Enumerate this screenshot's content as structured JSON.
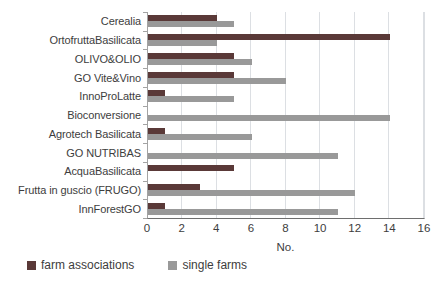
{
  "chart_data": {
    "type": "bar",
    "orientation": "horizontal",
    "title": "",
    "categories": [
      "Cerealia",
      "OrtofruttaBasilicata",
      "OLIVO&OLIO",
      "GO Vite&Vino",
      "InnoProLatte",
      "Bioconversione",
      "Agrotech Basilicata",
      "GO NUTRIBAS",
      "AcquaBasilicata",
      "Frutta in guscio (FRUGO)",
      "InnForestGO"
    ],
    "series": [
      {
        "name": "farm associations",
        "color": "#5a3938",
        "values": [
          4,
          14,
          5,
          5,
          1,
          0,
          1,
          0,
          5,
          3,
          1
        ]
      },
      {
        "name": "single farms",
        "color": "#999999",
        "values": [
          5,
          4,
          6,
          8,
          5,
          14,
          6,
          11,
          0,
          12,
          11
        ]
      }
    ],
    "xlabel": "No.",
    "xlim": [
      0,
      16
    ],
    "xticks": [
      0,
      2,
      4,
      6,
      8,
      10,
      12,
      14,
      16
    ],
    "grid": true,
    "gridline_color": "#dcdfe3",
    "axis_text_color": "#3d3d3d",
    "legend_position": "bottom-left"
  }
}
